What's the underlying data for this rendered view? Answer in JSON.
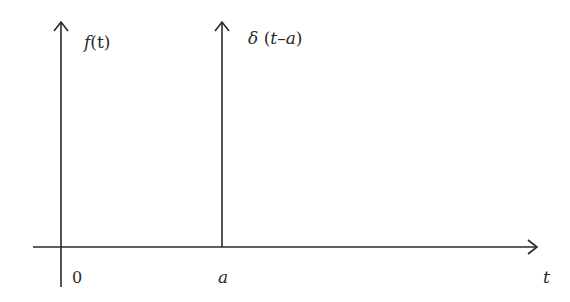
{
  "diagram": {
    "type": "impulse-function-plot",
    "y_axis_label": "f(t)",
    "x_axis_label": "t",
    "origin_label": "0",
    "impulse": {
      "label": "δ (t−a)",
      "position_label": "a"
    },
    "colors": {
      "ink": "#2a2a2a",
      "background": "#ffffff"
    }
  },
  "labels": {
    "f_prefix": "f",
    "f_args": "(t)",
    "delta_symbol": "δ",
    "delta_open": " (",
    "delta_t": "t",
    "delta_minus": "–",
    "delta_a": "a",
    "delta_close": ")",
    "origin": "0",
    "a": "a",
    "t": "t"
  }
}
